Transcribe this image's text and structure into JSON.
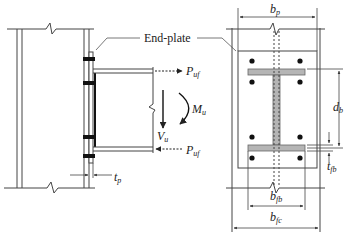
{
  "diagram": {
    "callout": {
      "text": "End-plate"
    },
    "side_view": {
      "forces": {
        "top_flange_force": {
          "main": "P",
          "sub": "uf"
        },
        "bottom_flange_force": {
          "main": "P",
          "sub": "uf"
        },
        "moment": {
          "main": "M",
          "sub": "u"
        },
        "shear": {
          "main": "V",
          "sub": "u"
        }
      },
      "dimensions": {
        "plate_thickness": {
          "main": "t",
          "sub": "p"
        }
      }
    },
    "front_view": {
      "dimensions": {
        "plate_width": {
          "main": "b",
          "sub": "p"
        },
        "beam_depth": {
          "main": "d",
          "sub": "b"
        },
        "beam_flange_thickness": {
          "main": "t",
          "sub": "fb"
        },
        "beam_flange_width": {
          "main": "b",
          "sub": "fb"
        },
        "column_flange_width": {
          "main": "b",
          "sub": "fc"
        }
      },
      "bolt_count": 8
    },
    "colors": {
      "line": "#333333",
      "beam_fill": "#b5b5b5",
      "bolt": "#111111",
      "background": "#ffffff"
    }
  }
}
